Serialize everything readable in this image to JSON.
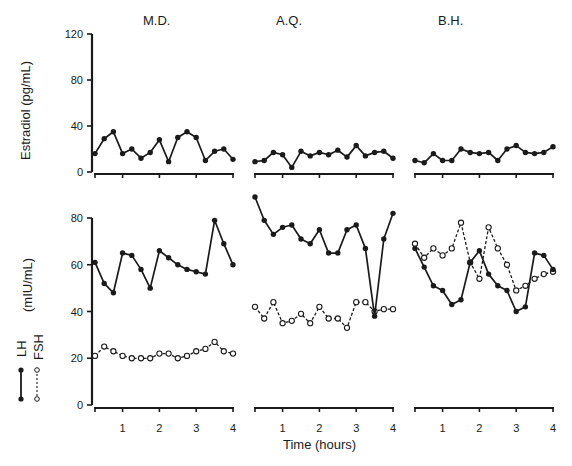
{
  "figure": {
    "subjects": [
      "M.D.",
      "A.Q.",
      "B.H."
    ],
    "top_ylabel": "Estradiol (pg/mL)",
    "bottom_ylabel": "(mIU/mL)",
    "legend": {
      "lh": "LH",
      "fsh": "FSH"
    },
    "xlabel": "Time (hours)",
    "top_yticks": [
      "0",
      "40",
      "80",
      "120"
    ],
    "bottom_yticks": [
      "0",
      "20",
      "40",
      "60",
      "80"
    ],
    "xticks": [
      "1",
      "2",
      "3",
      "4"
    ]
  },
  "chart_data": [
    {
      "type": "line",
      "title": "M.D.",
      "xlabel": "",
      "ylabel": "Estradiol (pg/mL)",
      "ylim": [
        0,
        120
      ],
      "x": [
        0.25,
        0.5,
        0.75,
        1,
        1.25,
        1.5,
        1.75,
        2,
        2.25,
        2.5,
        2.75,
        3,
        3.25,
        3.5,
        3.75,
        4
      ],
      "series": [
        {
          "name": "Estradiol",
          "values": [
            16,
            29,
            35,
            16,
            20,
            12,
            17,
            28,
            9,
            30,
            35,
            30,
            10,
            18,
            20,
            11
          ]
        }
      ]
    },
    {
      "type": "line",
      "title": "A.Q.",
      "ylabel": "Estradiol (pg/mL)",
      "ylim": [
        0,
        120
      ],
      "x": [
        0.25,
        0.5,
        0.75,
        1,
        1.25,
        1.5,
        1.75,
        2,
        2.25,
        2.5,
        2.75,
        3,
        3.25,
        3.5,
        3.75,
        4
      ],
      "series": [
        {
          "name": "Estradiol",
          "values": [
            9,
            10,
            17,
            15,
            4,
            18,
            14,
            17,
            15,
            19,
            13,
            23,
            14,
            17,
            18,
            12
          ]
        }
      ]
    },
    {
      "type": "line",
      "title": "B.H.",
      "ylabel": "Estradiol (pg/mL)",
      "ylim": [
        0,
        120
      ],
      "x": [
        0.25,
        0.5,
        0.75,
        1,
        1.25,
        1.5,
        1.75,
        2,
        2.25,
        2.5,
        2.75,
        3,
        3.25,
        3.5,
        3.75,
        4
      ],
      "series": [
        {
          "name": "Estradiol",
          "values": [
            10,
            8,
            16,
            10,
            10,
            20,
            17,
            16,
            17,
            10,
            20,
            23,
            17,
            16,
            17,
            22
          ]
        }
      ]
    },
    {
      "type": "line",
      "title": "M.D.",
      "xlabel": "Time (hours)",
      "ylabel": "LH / FSH (mIU/mL)",
      "ylim": [
        0,
        80
      ],
      "x": [
        0.25,
        0.5,
        0.75,
        1,
        1.25,
        1.5,
        1.75,
        2,
        2.25,
        2.5,
        2.75,
        3,
        3.25,
        3.5,
        3.75,
        4
      ],
      "series": [
        {
          "name": "LH",
          "values": [
            61,
            52,
            48,
            65,
            64,
            58,
            50,
            66,
            63,
            60,
            58,
            57,
            56,
            79,
            69,
            60
          ]
        },
        {
          "name": "FSH",
          "values": [
            21,
            25,
            23,
            21,
            20,
            20,
            20,
            22,
            22,
            20,
            21,
            23,
            24,
            27,
            23,
            22
          ]
        }
      ]
    },
    {
      "type": "line",
      "title": "A.Q.",
      "xlabel": "Time (hours)",
      "ylabel": "LH / FSH (mIU/mL)",
      "ylim": [
        0,
        80
      ],
      "x": [
        0.25,
        0.5,
        0.75,
        1,
        1.25,
        1.5,
        1.75,
        2,
        2.25,
        2.5,
        2.75,
        3,
        3.25,
        3.5,
        3.75,
        4
      ],
      "series": [
        {
          "name": "LH",
          "values": [
            89,
            79,
            73,
            76,
            77,
            71,
            69,
            75,
            65,
            65,
            75,
            77,
            67,
            38,
            71,
            82
          ]
        },
        {
          "name": "FSH",
          "values": [
            42,
            37,
            44,
            35,
            36,
            39,
            35,
            42,
            37,
            37,
            33,
            44,
            44,
            40,
            41,
            41
          ]
        }
      ]
    },
    {
      "type": "line",
      "title": "B.H.",
      "xlabel": "Time (hours)",
      "ylabel": "LH / FSH (mIU/mL)",
      "ylim": [
        0,
        80
      ],
      "x": [
        0.25,
        0.5,
        0.75,
        1,
        1.25,
        1.5,
        1.75,
        2,
        2.25,
        2.5,
        2.75,
        3,
        3.25,
        3.5,
        3.75,
        4
      ],
      "series": [
        {
          "name": "LH",
          "values": [
            67,
            59,
            51,
            49,
            43,
            45,
            61,
            66,
            56,
            51,
            49,
            40,
            42,
            65,
            64,
            58
          ]
        },
        {
          "name": "FSH",
          "values": [
            69,
            63,
            67,
            64,
            67,
            78,
            61,
            54,
            76,
            67,
            60,
            49,
            51,
            54,
            56,
            57
          ]
        }
      ]
    }
  ]
}
